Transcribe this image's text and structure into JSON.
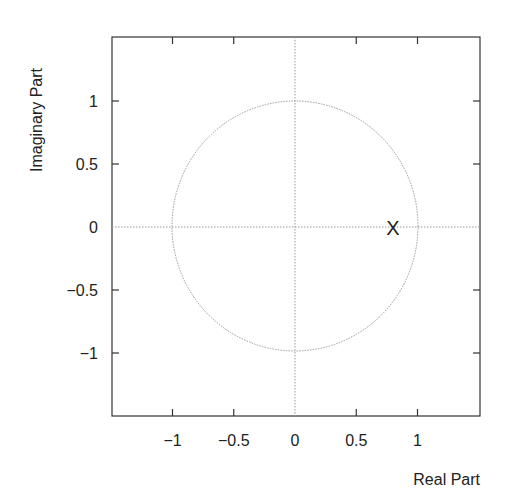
{
  "chart_data": {
    "type": "scatter",
    "title": "",
    "subtitle": "",
    "xlabel": "Real Part",
    "ylabel": "Imaginary Part",
    "xlim": [
      -1.5,
      1.5
    ],
    "ylim": [
      -1.5,
      1.5
    ],
    "grid": false,
    "legend": null,
    "x_ticks": [
      -1,
      -0.5,
      0,
      0.5,
      1
    ],
    "x_tick_labels": [
      "−1",
      "−0.5",
      "0",
      "0.5",
      "1"
    ],
    "y_ticks": [
      1,
      0.5,
      0,
      -0.5,
      -1
    ],
    "y_tick_labels": [
      "1",
      "0.5",
      "0",
      "−0.5",
      "−1"
    ],
    "reference_lines": [
      {
        "orientation": "horizontal",
        "value": 0,
        "style": "dotted"
      },
      {
        "orientation": "vertical",
        "value": 0,
        "style": "dotted"
      }
    ],
    "unit_circle": {
      "center": [
        0,
        0
      ],
      "radius": 1,
      "style": "dotted"
    },
    "series": [
      {
        "name": "poles",
        "marker": "x",
        "points": [
          {
            "x": 0.8,
            "y": 0
          }
        ]
      }
    ]
  },
  "labels": {
    "xlabel": "Real Part",
    "ylabel": "Imaginary Part",
    "marker_glyph": "X"
  },
  "colors": {
    "axis": "#333333",
    "reference": "#9a9a9a",
    "text": "#222222"
  }
}
